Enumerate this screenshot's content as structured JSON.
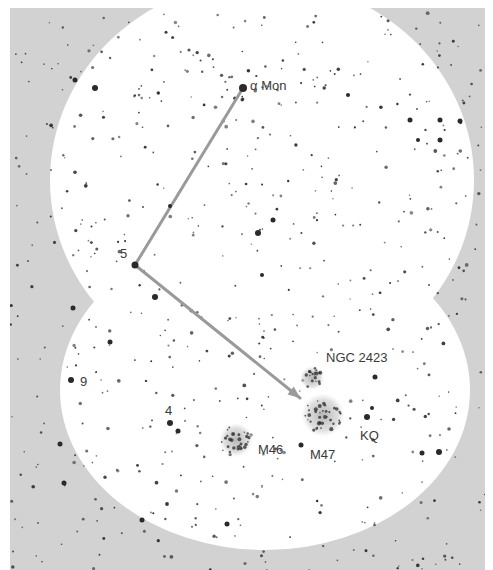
{
  "chart_data": {
    "type": "finder-chart",
    "title": "",
    "colors": {
      "page": "#ffffff",
      "sky_outside_field": "#d2d2d2",
      "field_of_view": "#ffffff",
      "star": "#2a2a2a",
      "pointer_line": "#9a9a9a",
      "label": "#3a3a3a",
      "cluster_haze": "#bdbdbd"
    },
    "frame": {
      "x": 10,
      "y": 8,
      "width": 475,
      "height": 562
    },
    "fields_of_view": [
      {
        "name": "upper-field",
        "cx": 262,
        "cy": 180,
        "rx": 212,
        "ry": 200
      },
      {
        "name": "lower-field",
        "cx": 265,
        "cy": 390,
        "rx": 205,
        "ry": 160
      }
    ],
    "labels": [
      {
        "id": "alpha-mon",
        "text": "α Mon",
        "x": 250,
        "y": 90,
        "size": 13
      },
      {
        "id": "star-5",
        "text": "5",
        "x": 120,
        "y": 258,
        "size": 15
      },
      {
        "id": "star-9",
        "text": "9",
        "x": 80,
        "y": 386,
        "size": 15
      },
      {
        "id": "star-4",
        "text": "4",
        "x": 165,
        "y": 415,
        "size": 15
      },
      {
        "id": "ngc-2423",
        "text": "NGC 2423",
        "x": 326,
        "y": 362,
        "size": 13
      },
      {
        "id": "m46",
        "text": "M46",
        "x": 258,
        "y": 454,
        "size": 14
      },
      {
        "id": "m47",
        "text": "M47",
        "x": 310,
        "y": 459,
        "size": 14
      },
      {
        "id": "kq",
        "text": "KQ",
        "x": 360,
        "y": 440,
        "size": 13
      }
    ],
    "pointer_path": {
      "points": [
        [
          243,
          88
        ],
        [
          135,
          265
        ],
        [
          300,
          398
        ]
      ],
      "arrowhead_at": [
        300,
        398
      ]
    },
    "clusters": [
      {
        "name": "M46",
        "cx": 236,
        "cy": 440,
        "r": 17
      },
      {
        "name": "M47",
        "cx": 323,
        "cy": 415,
        "r": 22
      },
      {
        "name": "NGC 2423",
        "cx": 312,
        "cy": 378,
        "r": 12
      }
    ],
    "bright_stars": [
      {
        "name": "alpha-mon",
        "x": 243,
        "y": 88,
        "r": 4
      },
      {
        "name": "star-5",
        "x": 135,
        "y": 265,
        "r": 3.5
      },
      {
        "name": "star-9",
        "x": 71,
        "y": 380,
        "r": 3
      },
      {
        "name": "star-4",
        "x": 170,
        "y": 423,
        "r": 3
      },
      {
        "name": "star",
        "x": 178,
        "y": 431,
        "r": 2.5
      },
      {
        "name": "star",
        "x": 155,
        "y": 297,
        "r": 3
      },
      {
        "name": "star",
        "x": 258,
        "y": 233,
        "r": 3
      },
      {
        "name": "star",
        "x": 273,
        "y": 220,
        "r": 2.5
      },
      {
        "name": "star",
        "x": 110,
        "y": 342,
        "r": 2.5
      },
      {
        "name": "star",
        "x": 73,
        "y": 308,
        "r": 2.5
      },
      {
        "name": "star",
        "x": 95,
        "y": 88,
        "r": 3
      },
      {
        "name": "star",
        "x": 75,
        "y": 80,
        "r": 2.5
      },
      {
        "name": "star",
        "x": 410,
        "y": 120,
        "r": 2.5
      },
      {
        "name": "star",
        "x": 440,
        "y": 140,
        "r": 2.5
      },
      {
        "name": "star",
        "x": 460,
        "y": 121,
        "r": 2.5
      },
      {
        "name": "star",
        "x": 440,
        "y": 120,
        "r": 2.5
      },
      {
        "name": "star",
        "x": 375,
        "y": 377,
        "r": 2.5
      },
      {
        "name": "star",
        "x": 367,
        "y": 417,
        "r": 3
      },
      {
        "name": "star",
        "x": 372,
        "y": 408,
        "r": 2
      },
      {
        "name": "star",
        "x": 439,
        "y": 452,
        "r": 3
      },
      {
        "name": "star",
        "x": 422,
        "y": 453,
        "r": 2.5
      },
      {
        "name": "star",
        "x": 301,
        "y": 445,
        "r": 2.5
      },
      {
        "name": "star",
        "x": 60,
        "y": 444,
        "r": 2.5
      },
      {
        "name": "star",
        "x": 142,
        "y": 520,
        "r": 2.5
      },
      {
        "name": "star",
        "x": 64,
        "y": 483,
        "r": 2.5
      },
      {
        "name": "star",
        "x": 227,
        "y": 524,
        "r": 2.5
      },
      {
        "name": "star",
        "x": 348,
        "y": 95,
        "r": 2
      },
      {
        "name": "star",
        "x": 418,
        "y": 140,
        "r": 2
      },
      {
        "name": "star",
        "x": 262,
        "y": 275,
        "r": 2
      },
      {
        "name": "star",
        "x": 170,
        "y": 206,
        "r": 2
      }
    ],
    "faint_star_field": {
      "seed": 47,
      "count": 620,
      "min_r": 0.8,
      "max_r": 1.9
    }
  }
}
